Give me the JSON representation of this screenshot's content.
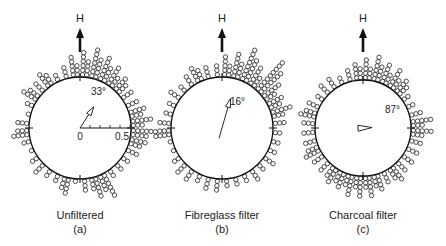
{
  "figure": {
    "north_label": "H",
    "panels": [
      {
        "id": "a",
        "title": "Unfiltered",
        "letter": "(a)",
        "center": [
          80,
          128
        ],
        "radius": 51,
        "mean_angle_deg": 33,
        "mean_angle_label": "33°",
        "vector_length": 0.26,
        "scale_bar": {
          "start_label": "0",
          "end_label": "0.5",
          "ticks": 5
        }
      },
      {
        "id": "b",
        "title": "Fibreglass filter",
        "letter": "(b)",
        "center": [
          222,
          128
        ],
        "radius": 51,
        "mean_angle_deg": 16,
        "mean_angle_label": "16°",
        "vector_length": 0.3
      },
      {
        "id": "c",
        "title": "Charcoal filter",
        "letter": "(c)",
        "center": [
          363,
          128
        ],
        "radius": 48,
        "mean_angle_deg": 87,
        "mean_angle_label": "87°",
        "vector_length": 0.18
      }
    ]
  },
  "chart_data": [
    {
      "type": "circular_histogram",
      "title": "Unfiltered (a)",
      "bin_width_deg": 10,
      "bin_start_deg": [
        0,
        10,
        20,
        30,
        40,
        50,
        60,
        70,
        80,
        90,
        100,
        110,
        120,
        130,
        140,
        150,
        160,
        170,
        180,
        190,
        200,
        210,
        220,
        230,
        240,
        250,
        260,
        270,
        280,
        290,
        300,
        310,
        320,
        330,
        340,
        350
      ],
      "counts": [
        6,
        7,
        6,
        5,
        4,
        3,
        3,
        4,
        5,
        6,
        4,
        3,
        2,
        2,
        2,
        6,
        5,
        3,
        1,
        4,
        2,
        2,
        3,
        2,
        1,
        2,
        4,
        3,
        1,
        2,
        4,
        3,
        4,
        2,
        3,
        5
      ],
      "mean_direction_deg": 33,
      "mean_vector_length_scale": [
        0,
        0.5
      ]
    },
    {
      "type": "circular_histogram",
      "title": "Fibreglass filter (b)",
      "bin_width_deg": 10,
      "bin_start_deg": [
        0,
        10,
        20,
        30,
        40,
        50,
        60,
        70,
        80,
        90,
        100,
        110,
        120,
        130,
        140,
        150,
        160,
        170,
        180,
        190,
        200,
        210,
        220,
        230,
        240,
        250,
        260,
        270,
        280,
        290,
        300,
        310,
        320,
        330,
        340,
        350
      ],
      "counts": [
        5,
        6,
        8,
        5,
        10,
        5,
        4,
        5,
        3,
        2,
        2,
        2,
        3,
        2,
        3,
        2,
        2,
        2,
        3,
        3,
        2,
        3,
        3,
        2,
        1,
        1,
        4,
        3,
        2,
        2,
        3,
        2,
        3,
        4,
        3,
        3
      ],
      "mean_direction_deg": 16
    },
    {
      "type": "circular_histogram",
      "title": "Charcoal filter (c)",
      "bin_width_deg": 10,
      "bin_start_deg": [
        0,
        10,
        20,
        30,
        40,
        50,
        60,
        70,
        80,
        90,
        100,
        110,
        120,
        130,
        140,
        150,
        160,
        170,
        180,
        190,
        200,
        210,
        220,
        230,
        240,
        250,
        260,
        270,
        280,
        290,
        300,
        310,
        320,
        330,
        340,
        350
      ],
      "counts": [
        5,
        6,
        5,
        5,
        4,
        2,
        2,
        3,
        5,
        5,
        3,
        3,
        3,
        3,
        4,
        3,
        4,
        5,
        5,
        5,
        4,
        4,
        3,
        3,
        4,
        3,
        3,
        3,
        4,
        3,
        2,
        3,
        3,
        2,
        3,
        4
      ],
      "mean_direction_deg": 87
    }
  ]
}
